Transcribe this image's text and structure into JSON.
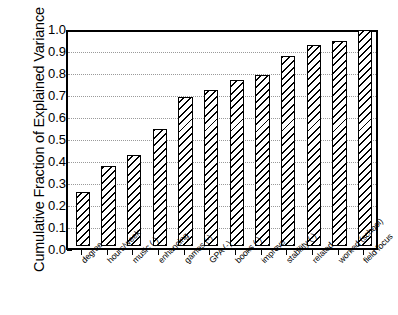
{
  "chart_data": {
    "type": "bar",
    "title": "",
    "xlabel": "",
    "ylabel": "Cumulative Fraction of Explained Variance",
    "ylim": [
      0.0,
      1.0
    ],
    "yticks": [
      "0.0",
      "0.1",
      "0.2",
      "0.3",
      "0.4",
      "0.5",
      "0.6",
      "0.7",
      "0.8",
      "0.9",
      "1.0"
    ],
    "grid": true,
    "legend": "none",
    "categories": [
      "degree",
      "hours/week",
      "music (-)",
      "enhancing",
      "games (-)",
      "GPA (-)",
      "books (-)",
      "improve",
      "stability (-)",
      "related",
      "worked (school)",
      "field focus"
    ],
    "values": [
      0.25,
      0.37,
      0.42,
      0.54,
      0.69,
      0.72,
      0.77,
      0.79,
      0.88,
      0.93,
      0.95,
      1.0
    ],
    "bar_color": "#ffffff",
    "bar_edge_color": "#000000",
    "bar_hatch": "diagonal-lines",
    "axis_color": "#000000",
    "gridline_color": "#9a9a9a",
    "background": "#ffffff"
  }
}
